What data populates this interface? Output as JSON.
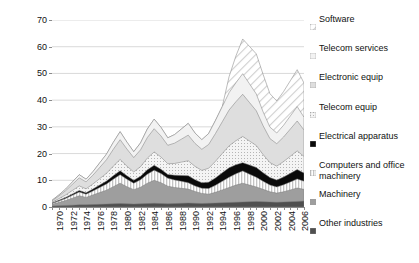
{
  "chart_data": {
    "type": "area",
    "stacked": true,
    "title": "",
    "xlabel": "",
    "ylabel": "",
    "ylim": [
      0,
      70
    ],
    "yticks": [
      0,
      10,
      20,
      30,
      40,
      50,
      60,
      70
    ],
    "grid": true,
    "legend_position": "right",
    "x": [
      1970,
      1971,
      1972,
      1973,
      1974,
      1975,
      1976,
      1977,
      1978,
      1979,
      1980,
      1981,
      1982,
      1983,
      1984,
      1985,
      1986,
      1987,
      1988,
      1989,
      1990,
      1991,
      1992,
      1993,
      1994,
      1995,
      1996,
      1997,
      1998,
      1999,
      2000,
      2001,
      2002,
      2003,
      2004,
      2005,
      2006,
      2007
    ],
    "xtick_labels": [
      "1970",
      "1972",
      "1974",
      "1976",
      "1978",
      "1980",
      "1982",
      "1984",
      "1986",
      "1988",
      "1990",
      "1992",
      "1994",
      "1996",
      "1998",
      "2000",
      "2002",
      "2004",
      "2006"
    ],
    "series": [
      {
        "name": "Other industries",
        "color": "#4d4d4d",
        "pattern": "solid-dark-gray",
        "values": [
          0.4,
          0.5,
          0.6,
          0.7,
          0.8,
          0.8,
          0.9,
          1.0,
          1.1,
          1.2,
          1.3,
          1.2,
          1.1,
          1.2,
          1.3,
          1.4,
          1.3,
          1.2,
          1.3,
          1.4,
          1.5,
          1.4,
          1.3,
          1.4,
          1.5,
          1.6,
          1.7,
          1.8,
          1.9,
          2.0,
          2.1,
          2.0,
          1.9,
          1.8,
          1.9,
          2.0,
          2.1,
          2.2
        ]
      },
      {
        "name": "Machinery",
        "color": "#9b9b9b",
        "pattern": "solid-mid-gray",
        "values": [
          0.6,
          1.2,
          1.8,
          2.6,
          3.4,
          2.8,
          3.6,
          4.4,
          5.2,
          6.4,
          7.6,
          6.4,
          5.4,
          6.2,
          7.6,
          8.6,
          7.8,
          6.6,
          6.0,
          5.6,
          5.2,
          4.4,
          3.8,
          3.4,
          4.0,
          4.8,
          5.6,
          6.4,
          7.0,
          6.2,
          5.4,
          4.6,
          3.8,
          3.4,
          3.8,
          4.4,
          5.0,
          4.4
        ]
      },
      {
        "name": "Computers and office machinery",
        "color": "#d8d8d8",
        "pattern": "vertical-stripes",
        "values": [
          0.3,
          0.5,
          0.8,
          1.1,
          1.4,
          1.2,
          1.5,
          1.9,
          2.3,
          2.8,
          3.2,
          2.8,
          2.4,
          2.8,
          3.4,
          3.8,
          3.4,
          3.0,
          2.8,
          2.6,
          2.4,
          2.1,
          1.9,
          2.1,
          2.6,
          3.2,
          3.8,
          4.2,
          4.6,
          4.1,
          3.6,
          3.0,
          2.5,
          2.3,
          2.6,
          3.0,
          3.4,
          3.0
        ]
      },
      {
        "name": "Electrical apparatus",
        "color": "#000000",
        "pattern": "solid-black",
        "values": [
          0.2,
          0.3,
          0.4,
          0.5,
          0.6,
          0.5,
          0.7,
          0.9,
          1.1,
          1.3,
          1.5,
          1.3,
          1.1,
          1.3,
          1.6,
          1.8,
          1.6,
          1.4,
          1.8,
          2.2,
          2.6,
          2.3,
          2.1,
          2.4,
          2.8,
          3.2,
          3.6,
          3.4,
          3.1,
          3.4,
          3.7,
          3.2,
          2.8,
          2.6,
          2.9,
          3.2,
          3.5,
          3.1
        ]
      },
      {
        "name": "Telecom equip",
        "color": "#ececec",
        "pattern": "fine-dots",
        "values": [
          0.3,
          0.6,
          0.9,
          1.3,
          1.7,
          1.5,
          1.9,
          2.4,
          2.9,
          3.6,
          4.2,
          3.6,
          3.1,
          3.6,
          4.4,
          5.0,
          4.6,
          4.0,
          4.4,
          5.0,
          5.6,
          5.0,
          4.6,
          5.2,
          6.2,
          7.2,
          8.2,
          9.0,
          9.8,
          9.0,
          8.2,
          6.8,
          5.6,
          5.2,
          5.8,
          6.4,
          7.0,
          6.2
        ]
      },
      {
        "name": "Electronic equip",
        "color": "#e0e0e0",
        "pattern": "light-gray",
        "values": [
          0.5,
          1.0,
          1.6,
          2.3,
          3.0,
          2.6,
          3.3,
          4.2,
          5.1,
          6.3,
          7.4,
          6.4,
          5.4,
          6.3,
          7.7,
          8.7,
          7.9,
          6.9,
          7.6,
          8.6,
          9.6,
          8.6,
          7.9,
          8.9,
          10.4,
          11.9,
          13.4,
          14.6,
          15.8,
          14.4,
          13.0,
          10.8,
          9.0,
          8.4,
          9.2,
          10.2,
          11.2,
          9.9
        ]
      },
      {
        "name": "Telecom services",
        "color": "#f0f0f0",
        "pattern": "pale-gray",
        "values": [
          0.2,
          0.4,
          0.6,
          0.9,
          1.2,
          1.0,
          1.3,
          1.7,
          2.1,
          2.6,
          3.0,
          2.6,
          2.2,
          2.6,
          3.2,
          3.6,
          3.2,
          2.8,
          3.2,
          3.8,
          4.4,
          3.9,
          3.6,
          4.1,
          4.9,
          5.7,
          6.5,
          7.1,
          7.7,
          7.0,
          6.3,
          5.2,
          4.3,
          4.0,
          4.4,
          4.9,
          5.4,
          4.8
        ]
      },
      {
        "name": "Software",
        "color": "#f7f7f7",
        "pattern": "diagonal-hatch",
        "values": [
          0.0,
          0.0,
          0.0,
          0.0,
          0.0,
          0.0,
          0.0,
          0.0,
          0.0,
          0.0,
          0.0,
          0.0,
          0.0,
          0.0,
          0.0,
          0.0,
          0.0,
          0.0,
          0.0,
          0.0,
          0.0,
          0.0,
          0.0,
          0.0,
          0.0,
          0.0,
          6.0,
          10.0,
          13.0,
          14.0,
          15.0,
          14.0,
          12.5,
          12.0,
          12.6,
          13.2,
          13.8,
          12.8
        ]
      }
    ],
    "stack_totals": [
      2.5,
      4.5,
      6.7,
      9.4,
      12.1,
      10.4,
      13.2,
      16.5,
      19.8,
      24.2,
      28.2,
      24.3,
      20.7,
      24.2,
      29.2,
      32.9,
      29.8,
      25.9,
      27.1,
      29.2,
      31.3,
      27.7,
      25.2,
      27.5,
      32.4,
      37.6,
      48.8,
      56.5,
      62.9,
      60.1,
      57.3,
      47.6,
      42.4,
      39.7,
      43.2,
      47.3,
      51.4,
      46.4
    ]
  },
  "legend": {
    "items": [
      {
        "label": "Software",
        "swatch": "diagonal-hatch"
      },
      {
        "label": "Telecom services",
        "swatch": "pale-gray"
      },
      {
        "label": "Electronic equip",
        "swatch": "light-gray"
      },
      {
        "label": "Telecom equip",
        "swatch": "fine-dots"
      },
      {
        "label": "Electrical apparatus",
        "swatch": "solid-black"
      },
      {
        "label": "Computers and office machinery",
        "swatch": "vertical-stripes"
      },
      {
        "label": "Machinery",
        "swatch": "solid-mid-gray"
      },
      {
        "label": "Other industries",
        "swatch": "solid-dark-gray"
      }
    ]
  }
}
